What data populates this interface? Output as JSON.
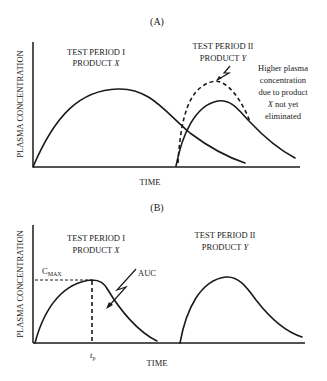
{
  "panel_a": {
    "title": "(A)",
    "y_axis_label": "PLASMA CONCENTRATION",
    "x_axis_label": "TIME",
    "period_1": {
      "line1": "TEST PERIOD I",
      "line2_prefix": "PRODUCT ",
      "line2_var": "X"
    },
    "period_2": {
      "line1": "TEST PERIOD II",
      "line2_prefix": "PRODUCT ",
      "line2_var": "Y"
    },
    "annotation": {
      "line1": "Higher plasma",
      "line2": "concentration",
      "line3": "due to product",
      "line4_var": "X",
      "line4_rest": " not yet",
      "line5": "eliminated"
    }
  },
  "panel_b": {
    "title": "(B)",
    "y_axis_label": "PLASMA CONCENTRATION",
    "x_axis_label": "TIME",
    "period_1": {
      "line1": "TEST PERIOD I",
      "line2_prefix": "PRODUCT ",
      "line2_var": "X"
    },
    "period_2": {
      "line1": "TEST PERIOD II",
      "line2_prefix": "PRODUCT ",
      "line2_var": "Y"
    },
    "cmax_label_main": "C",
    "cmax_label_sub": "MAX",
    "auc_label": "AUC",
    "tp_label_main": "t",
    "tp_label_sub": "p"
  }
}
